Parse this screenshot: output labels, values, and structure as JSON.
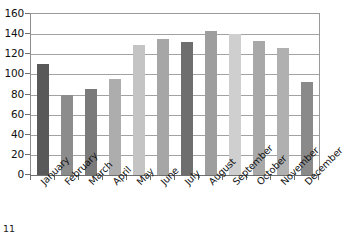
{
  "page": {
    "page_number": "11"
  },
  "chart_data": {
    "type": "bar",
    "title": "",
    "subtitle": "",
    "xlabel": "",
    "ylabel": "",
    "categories": [
      "January",
      "February",
      "March",
      "April",
      "May",
      "June",
      "July",
      "August",
      "September",
      "October",
      "November",
      "December"
    ],
    "values": [
      110,
      80,
      85,
      95,
      129,
      135,
      132,
      143,
      140,
      133,
      126,
      92
    ],
    "series": [
      {
        "name": "Monthly value",
        "values": [
          110,
          80,
          85,
          95,
          129,
          135,
          132,
          143,
          140,
          133,
          126,
          92
        ]
      }
    ],
    "bar_colors": [
      "#595959",
      "#8c8c8c",
      "#7a7a7a",
      "#adadad",
      "#c4c4c4",
      "#a6a6a6",
      "#6e6e6e",
      "#9e9e9e",
      "#cfcfcf",
      "#a8a8a8",
      "#b0b0b0",
      "#8a8a8a"
    ],
    "ylim": [
      0,
      160
    ],
    "ytick_step": 20,
    "yticks": [
      0,
      20,
      40,
      60,
      80,
      100,
      120,
      140,
      160
    ],
    "ytick_labels": [
      "0",
      "20",
      "40",
      "60",
      "80",
      "100",
      "120",
      "140",
      "160"
    ],
    "xtick_labels_rotation": -45,
    "grid": true,
    "grid_axis": "y",
    "legend": false,
    "legend_position": "none",
    "axis_color": "#6f6f6f",
    "gridline_color": "#a2a2a2",
    "background_color": "#ffffff"
  }
}
